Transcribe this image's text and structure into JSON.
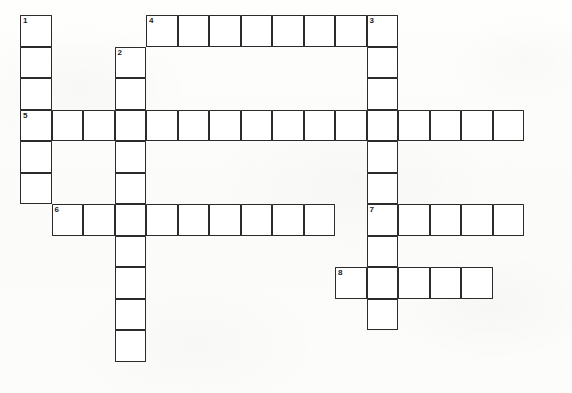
{
  "puzzle": {
    "title": "Crossword Puzzle Grid",
    "grid": {
      "columns": 16,
      "rows": 11,
      "cell_size": 31.5,
      "origin_x": 20,
      "origin_y": 15,
      "cell_fill_color": "#ffffff",
      "cell_border_color": "#2b2b2b",
      "background_color": "#fdfdfc",
      "number_color": "#1a1a1a"
    },
    "entries": [
      {
        "number": "1",
        "direction": "down",
        "start_col": 0,
        "start_row": 0,
        "length": 6
      },
      {
        "number": "2",
        "direction": "down",
        "start_col": 3,
        "start_row": 1,
        "length": 10
      },
      {
        "number": "3",
        "direction": "down",
        "start_col": 11,
        "start_row": 0,
        "length": 10
      },
      {
        "number": "4",
        "direction": "across",
        "start_col": 4,
        "start_row": 0,
        "length": 8
      },
      {
        "number": "5",
        "direction": "across",
        "start_col": 0,
        "start_row": 3,
        "length": 16
      },
      {
        "number": "6",
        "direction": "across",
        "start_col": 1,
        "start_row": 6,
        "length": 9
      },
      {
        "number": "7",
        "direction": "across",
        "start_col": 11,
        "start_row": 6,
        "length": 5
      },
      {
        "number": "8",
        "direction": "across",
        "start_col": 10,
        "start_row": 8,
        "length": 5
      }
    ],
    "numbered_cells": [
      {
        "number": "1",
        "col": 0,
        "row": 0
      },
      {
        "number": "2",
        "col": 3,
        "row": 1
      },
      {
        "number": "3",
        "col": 11,
        "row": 0
      },
      {
        "number": "4",
        "col": 4,
        "row": 0
      },
      {
        "number": "5",
        "col": 0,
        "row": 3
      },
      {
        "number": "6",
        "col": 1,
        "row": 6
      },
      {
        "number": "7",
        "col": 11,
        "row": 6
      },
      {
        "number": "8",
        "col": 10,
        "row": 8
      }
    ],
    "letters": {}
  }
}
